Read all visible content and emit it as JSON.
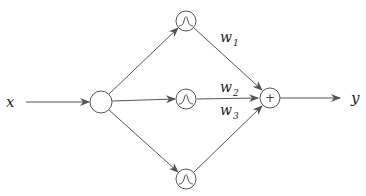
{
  "diagram": {
    "type": "rbf-network",
    "input_label": "x",
    "output_label": "y",
    "nodes": {
      "input": {
        "name": "input-node",
        "symbol": ""
      },
      "hidden": [
        {
          "name": "gaussian-node-1",
          "symbol": "gaussian"
        },
        {
          "name": "gaussian-node-2",
          "symbol": "gaussian"
        },
        {
          "name": "gaussian-node-3",
          "symbol": "gaussian"
        }
      ],
      "sum": {
        "name": "sum-node",
        "symbol": "+"
      }
    },
    "weights": [
      {
        "base": "w",
        "sub": "1"
      },
      {
        "base": "w",
        "sub": "2"
      },
      {
        "base": "w",
        "sub": "3"
      }
    ],
    "colors": {
      "stroke": "#555555",
      "text": "#222222",
      "background": "#ffffff"
    }
  }
}
